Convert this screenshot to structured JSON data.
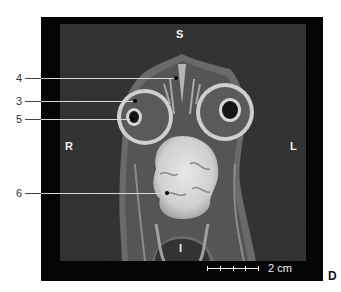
{
  "figure": {
    "panel_letter": "D",
    "modality": "MRI coronal section",
    "orientation_labels": {
      "superior": "S",
      "inferior": "I",
      "right": "R",
      "left": "L"
    },
    "callouts": [
      {
        "number": "4"
      },
      {
        "number": "3"
      },
      {
        "number": "5"
      },
      {
        "number": "6"
      }
    ],
    "scale_bar": {
      "label": "2 cm",
      "ticks": 5
    },
    "colors": {
      "frame": "#050505",
      "background_tissue": "#2f2f2f",
      "label_text": "#f2f2f2",
      "callout_text": "#333333"
    }
  }
}
